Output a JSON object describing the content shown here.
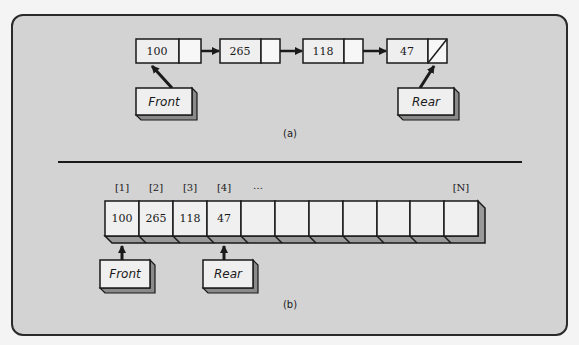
{
  "figure": {
    "linked": {
      "caption": "(a)",
      "nodes": [
        {
          "value": "100",
          "next": "pointer"
        },
        {
          "value": "265",
          "next": "pointer"
        },
        {
          "value": "118",
          "next": "pointer"
        },
        {
          "value": "47",
          "next": "null"
        }
      ],
      "front_label": "Front",
      "rear_label": "Rear"
    },
    "array": {
      "caption": "(b)",
      "indices": [
        "[1]",
        "[2]",
        "[3]",
        "[4]",
        "…",
        "[N]"
      ],
      "cells": [
        "100",
        "265",
        "118",
        "47",
        "",
        "",
        "",
        "",
        "",
        "",
        ""
      ],
      "front_label": "Front",
      "rear_label": "Rear"
    }
  },
  "colors": {
    "background": "#d3d3d3",
    "box_fill": "#efefef",
    "ink": "#1a1a1a",
    "shadow": "#8a8a8a"
  }
}
